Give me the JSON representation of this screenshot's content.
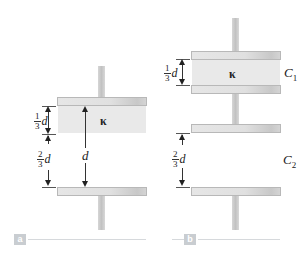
{
  "figure": {
    "panels": [
      {
        "id": "a",
        "label": "a",
        "dielectric_symbol": "κ",
        "labels": {
          "top_fraction": {
            "numerator": "1",
            "denominator": "3",
            "variable": "d"
          },
          "bottom_fraction": {
            "numerator": "2",
            "denominator": "3",
            "variable": "d"
          },
          "total_gap": "d"
        }
      },
      {
        "id": "b",
        "label": "b",
        "dielectric_symbol": "κ",
        "labels": {
          "top_fraction": {
            "numerator": "1",
            "denominator": "3",
            "variable": "d"
          },
          "bottom_fraction": {
            "numerator": "2",
            "denominator": "3",
            "variable": "d"
          },
          "capacitor_1": "C",
          "capacitor_1_sub": "1",
          "capacitor_2": "C",
          "capacitor_2_sub": "2"
        }
      }
    ],
    "colors": {
      "plate": "#e0e0e0",
      "dielectric": "#e9e9e9",
      "label_box": "#c9cdd1",
      "line": "#333333"
    }
  }
}
